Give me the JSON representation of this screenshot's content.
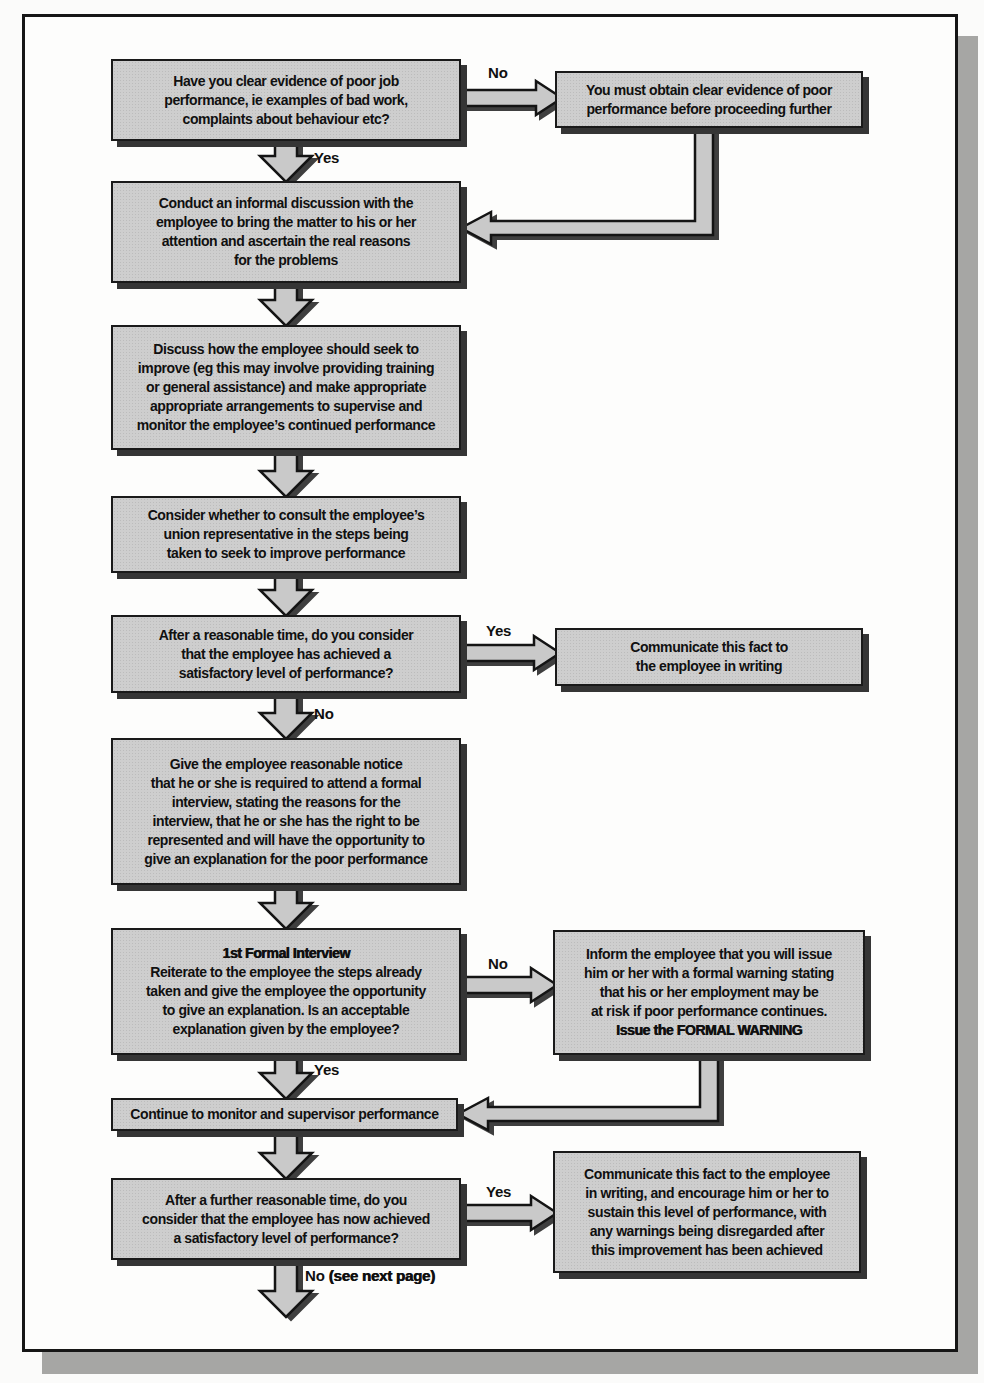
{
  "labels": {
    "yes": "Yes",
    "no": "No",
    "see_next_page": "(see next page)"
  },
  "boxes": {
    "evidence_question": {
      "text": "Have you clear evidence of poor job\nperformance, ie examples of bad work,\ncomplaints about behaviour etc?"
    },
    "obtain_evidence": {
      "text": "You must obtain clear evidence of poor\nperformance before proceeding further"
    },
    "informal_discussion": {
      "text": "Conduct an informal discussion with the\nemployee to bring the matter to his or her\nattention and ascertain the real reasons\nfor the problems"
    },
    "discuss_improvement": {
      "text": "Discuss how the employee should seek to\nimprove (eg this may involve providing training\nor general assistance) and make appropriate\nappropriate arrangements to supervise and\nmonitor the employee’s continued performance"
    },
    "consider_union": {
      "text": "Consider whether to consult the employee’s\nunion representative in the steps being\ntaken to seek to improve performance"
    },
    "reasonable_time_question": {
      "text": "After a reasonable time, do you consider\nthat the employee has achieved a\nsatisfactory level of performance?"
    },
    "communicate_in_writing": {
      "text": "Communicate this fact to\nthe employee in writing"
    },
    "formal_interview_notice": {
      "text": "Give the employee reasonable notice\nthat he or she is required to attend a formal\ninterview, stating the reasons for the\ninterview, that he or she has the right to be\nrepresented and will have the opportunity to\ngive an explanation for the poor performance"
    },
    "first_formal_interview": {
      "title": "1st Formal Interview",
      "text": "Reiterate to the employee the steps already\ntaken and give the employee the opportunity\nto give an explanation. Is an acceptable\nexplanation given by the employee?"
    },
    "issue_formal_warning": {
      "text": "Inform the employee that you will issue\nhim or her with a formal warning stating\nthat his or her employment may be\nat risk if poor performance continues.",
      "emphasis": "Issue the FORMAL WARNING"
    },
    "continue_monitor": {
      "text": "Continue to monitor and supervisor performance"
    },
    "further_time_question": {
      "text": "After a further reasonable time, do you\nconsider that the employee has now achieved\na satisfactory level of performance?"
    },
    "communicate_sustain": {
      "text": "Communicate this fact to the employee\nin writing, and encourage him or her to\nsustain this level of performance, with\nany warnings being disregarded after\nthis improvement has been achieved"
    }
  }
}
